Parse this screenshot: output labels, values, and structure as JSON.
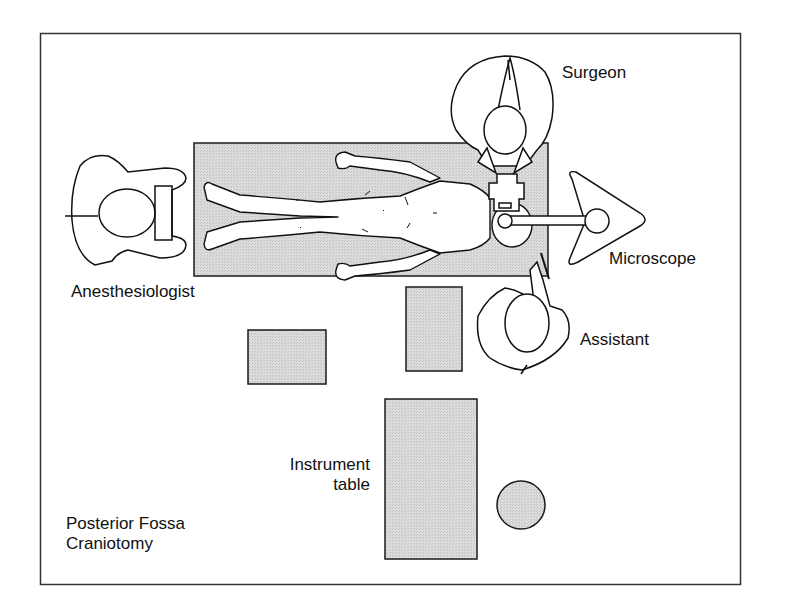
{
  "diagram": {
    "title": "Posterior Fossa Craniotomy",
    "title_lines": [
      "Posterior Fossa",
      "Craniotomy"
    ],
    "colors": {
      "frame": "#333333",
      "fill_gray": "#d9d9d9",
      "stroke": "#1a1a1a",
      "background": "#ffffff"
    },
    "labels": {
      "surgeon": "Surgeon",
      "microscope": "Microscope",
      "anesthesiologist": "Anesthesiologist",
      "assistant": "Assistant",
      "instrument_table_line1": "Instrument",
      "instrument_table_line2": "table"
    },
    "elements": [
      {
        "id": "operating-table",
        "type": "rect",
        "label": "operating table with patient (prone)"
      },
      {
        "id": "surgeon",
        "type": "person",
        "label": "Surgeon"
      },
      {
        "id": "anesthesiologist",
        "type": "person",
        "label": "Anesthesiologist"
      },
      {
        "id": "assistant",
        "type": "person",
        "label": "Assistant"
      },
      {
        "id": "microscope",
        "type": "equipment",
        "label": "Microscope"
      },
      {
        "id": "instrument-table",
        "type": "rect",
        "label": "Instrument table"
      },
      {
        "id": "small-table-left",
        "type": "rect",
        "label": ""
      },
      {
        "id": "small-table-center",
        "type": "rect",
        "label": ""
      },
      {
        "id": "round-stool",
        "type": "circle",
        "label": ""
      }
    ]
  }
}
